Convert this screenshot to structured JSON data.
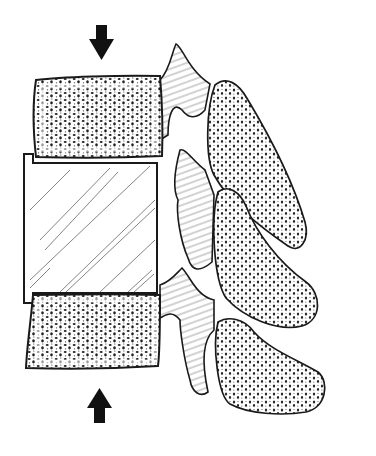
{
  "figure": {
    "background": "#ffffff",
    "ink": "#1a1a1a",
    "hatch": "#555555",
    "elements": {
      "arrow_top": {
        "direction": "down",
        "icon": "arrow-down-icon"
      },
      "arrow_bottom": {
        "direction": "up",
        "icon": "arrow-up-icon"
      },
      "upper_vertebral_body": {
        "texture": "cancellous-bone"
      },
      "interbody_spacer": {
        "texture": "diagonal-hatch"
      },
      "lower_vertebral_body": {
        "texture": "cancellous-bone"
      },
      "spinous_processes": 3
    }
  }
}
